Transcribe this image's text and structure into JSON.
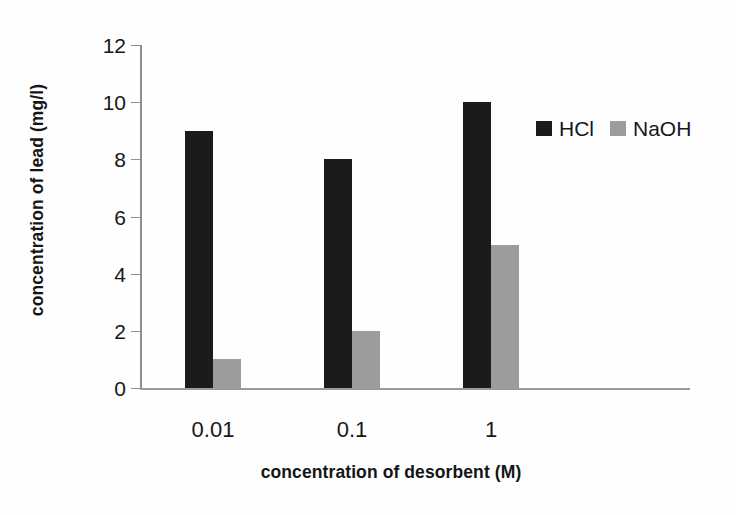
{
  "chart_data": {
    "type": "bar",
    "title": "",
    "subtitle": "",
    "xlabel": "concentration of desorbent (M)",
    "ylabel": "concentration of lead  (mg/l)",
    "categories": [
      "0.01",
      "0.1",
      "1"
    ],
    "series": [
      {
        "name": "HCl",
        "values": [
          9,
          8,
          10
        ],
        "color": "#1b1b1b"
      },
      {
        "name": "NaOH",
        "values": [
          1,
          2,
          5
        ],
        "color": "#9c9c9c"
      }
    ],
    "ylim": [
      0,
      12
    ],
    "yticks": [
      0,
      2,
      4,
      6,
      8,
      10,
      12
    ],
    "ytick_labels": [
      "0",
      "2",
      "4",
      "6",
      "8",
      "10",
      "12"
    ],
    "grid": false,
    "legend_position": "top-right",
    "legend_entries": [
      "HCl",
      "NaOH"
    ],
    "annotations": []
  },
  "axes": {
    "y_title": "concentration of lead  (mg/l)",
    "x_title": "concentration of desorbent (M)"
  },
  "legend": {
    "items": [
      {
        "label": "HCl",
        "swatch": "black-square-swatch"
      },
      {
        "label": "NaOH",
        "swatch": "gray-square-swatch"
      }
    ]
  }
}
